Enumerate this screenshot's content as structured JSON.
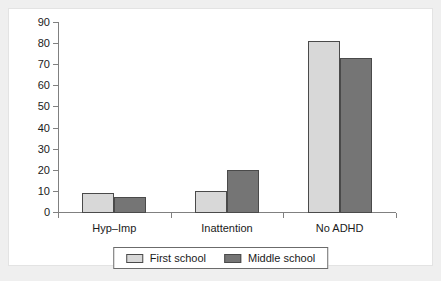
{
  "chart_data": {
    "type": "bar",
    "title": "",
    "subtitle": "",
    "xlabel": "",
    "ylabel": "",
    "categories": [
      "Hyp–Imp",
      "Inattention",
      "No ADHD"
    ],
    "series": [
      {
        "name": "First school",
        "values": [
          9,
          10,
          81
        ],
        "color": "#d8d8d8"
      },
      {
        "name": "Middle school",
        "values": [
          7,
          20,
          73
        ],
        "color": "#757575"
      }
    ],
    "ylim": [
      0,
      90
    ],
    "ytick_step": 10,
    "yticks": [
      0,
      10,
      20,
      30,
      40,
      50,
      60,
      70,
      80,
      90
    ],
    "ytick_labels": [
      "0",
      "10",
      "20",
      "30",
      "40",
      "50",
      "60",
      "70",
      "80",
      "90"
    ],
    "grid": false,
    "legend_position": "bottom-center",
    "bar_edge_color": "#4a4a4a",
    "axis_color": "#808080",
    "panel_background": "#ffffff",
    "figure_background": "#efefef"
  },
  "legend": {
    "entries": [
      {
        "label": "First school",
        "swatch": "light"
      },
      {
        "label": "Middle school",
        "swatch": "dark"
      }
    ]
  }
}
